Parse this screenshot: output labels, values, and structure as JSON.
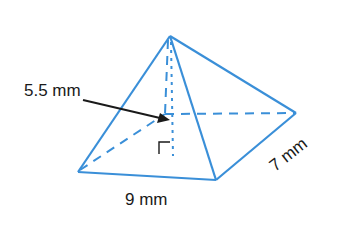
{
  "figure": {
    "type": "square pyramid (rectangular base)",
    "labels": {
      "height": "5.5 mm",
      "base_length": "9 mm",
      "base_width": "7 mm"
    },
    "colors": {
      "edge": "#3a8fd8",
      "arrow": "#1a1a1a",
      "text": "#1a1a1a"
    }
  }
}
